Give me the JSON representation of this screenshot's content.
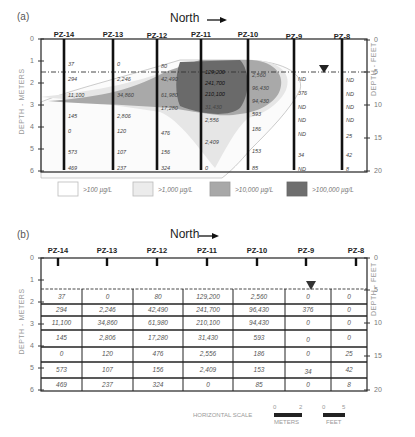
{
  "panel_a": {
    "label": "(a)",
    "north_label": "North",
    "wells": [
      "PZ-14",
      "PZ-13",
      "PZ-12",
      "PZ-11",
      "PZ-10",
      "PZ-9",
      "PZ-8"
    ],
    "left_axis": {
      "title": "DEPTH - METERS",
      "ticks": [
        "0",
        "1",
        "2",
        "3",
        "4",
        "5",
        "6"
      ]
    },
    "right_axis": {
      "title": "DEPTH - FEET",
      "ticks": [
        "0",
        "5",
        "10",
        "15",
        "20"
      ]
    },
    "values": {
      "PZ-14": [
        "37",
        "294",
        "11,100",
        "145",
        "0",
        "573",
        "469"
      ],
      "PZ-13": [
        "0",
        "2,246",
        "34,860",
        "2,806",
        "120",
        "107",
        "237"
      ],
      "PZ-12": [
        "80",
        "42,490",
        "61,980",
        "17,280",
        "476",
        "156",
        "324"
      ],
      "PZ-11": [
        "129,200",
        "241,700",
        "210,100",
        "31,430",
        "2,556",
        "2,409",
        "0"
      ],
      "PZ-10": [
        "2,560",
        "96,430",
        "94,430",
        "593",
        "186",
        "153",
        "85"
      ],
      "PZ-9": [
        "ND",
        "376",
        "ND",
        "ND",
        "ND",
        "34",
        "ND"
      ],
      "PZ-8": [
        "ND",
        "ND",
        "ND",
        "ND",
        "25",
        "42",
        "8"
      ]
    },
    "legend": [
      {
        "label": ">100 µg/L",
        "color": "#ffffff"
      },
      {
        "label": ">1,000 µg/L",
        "color": "#ececec"
      },
      {
        "label": ">10,000 µg/L",
        "color": "#a8a8a8"
      },
      {
        "label": ">100,000 µg/L",
        "color": "#6e6e6e"
      }
    ]
  },
  "panel_b": {
    "label": "(b)",
    "north_label": "North",
    "wells": [
      "PZ-14",
      "PZ-13",
      "PZ-12",
      "PZ-11",
      "PZ-10",
      "PZ-9",
      "PZ-8"
    ],
    "left_axis": {
      "title": "DEPTH - METERS",
      "ticks": [
        "0",
        "1",
        "2",
        "3",
        "4",
        "5",
        "6"
      ]
    },
    "right_axis": {
      "title": "DEPTH - FEET",
      "ticks": [
        "0",
        "5",
        "10",
        "15",
        "20"
      ]
    },
    "table": [
      [
        "37",
        "0",
        "80",
        "129,200",
        "2,560",
        "0",
        "0"
      ],
      [
        "294",
        "2,246",
        "42,490",
        "241,700",
        "96,430",
        "376",
        "0"
      ],
      [
        "11,100",
        "34,860",
        "61,980",
        "210,100",
        "94,430",
        "0",
        "0"
      ],
      [
        "145",
        "2,806",
        "17,280",
        "31,430",
        "593",
        "0",
        "0"
      ],
      [
        "0",
        "120",
        "476",
        "2,556",
        "186",
        "0",
        "25"
      ],
      [
        "573",
        "107",
        "156",
        "2,409",
        "153",
        "34",
        "42"
      ],
      [
        "469",
        "237",
        "324",
        "0",
        "85",
        "0",
        "8"
      ]
    ]
  },
  "scale": {
    "title": "HORIZONTAL SCALE",
    "meters": {
      "min": "0",
      "max": "2",
      "unit": "METERS"
    },
    "feet": {
      "min": "0",
      "max": "5",
      "unit": "FEET"
    }
  }
}
